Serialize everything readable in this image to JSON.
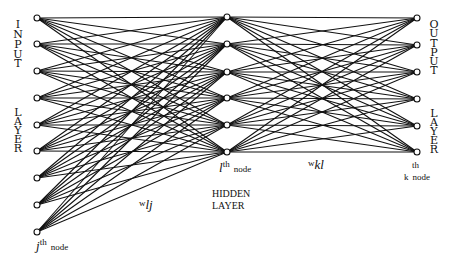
{
  "diagram": {
    "type": "neural-network",
    "colors": {
      "line": "#111111",
      "node_fill": "#ffffff",
      "node_stroke": "#111111",
      "background": "#ffffff"
    },
    "layers": {
      "input": {
        "label_letters": [
          "I",
          "N",
          "P",
          "U",
          "T",
          "",
          "L",
          "A",
          "Y",
          "E",
          "R"
        ],
        "x": 37,
        "nodes_y": [
          18,
          44,
          71,
          98,
          125,
          151,
          178,
          205,
          232
        ]
      },
      "hidden": {
        "label_line1": "HIDDEN",
        "label_line2": "LAYER",
        "x": 227,
        "nodes_y": [
          17,
          44,
          72,
          98,
          125,
          152
        ]
      },
      "output": {
        "label_letters": [
          "O",
          "U",
          "T",
          "P",
          "U",
          "T",
          "",
          "L",
          "A",
          "Y",
          "E",
          "R"
        ],
        "x": 417,
        "nodes_y": [
          18,
          45,
          72,
          99,
          126,
          152
        ]
      }
    },
    "annotations": {
      "j_node": {
        "var": "j",
        "sup": "th",
        "word": "node"
      },
      "l_node": {
        "var": "l",
        "sup": "th",
        "word": "node"
      },
      "k_node": {
        "var": "k",
        "sup": "th",
        "word": "node"
      },
      "w_lj": {
        "w": "w",
        "sub": "lj"
      },
      "w_kl": {
        "w": "w",
        "sub": "kl"
      }
    }
  }
}
